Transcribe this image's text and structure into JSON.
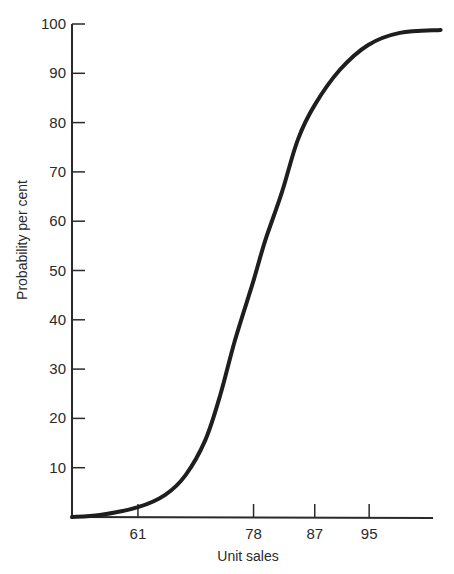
{
  "chart_data": {
    "type": "line",
    "title": "",
    "xlabel": "Unit sales",
    "ylabel": "Probability per cent",
    "xlim": [
      51.3,
      104.4
    ],
    "ylim": [
      0,
      100
    ],
    "x_ticks": [
      61,
      78,
      87,
      95
    ],
    "y_ticks": [
      10,
      20,
      30,
      40,
      50,
      60,
      70,
      80,
      90,
      100
    ],
    "grid": false,
    "legend": null,
    "series": [
      {
        "name": "Cumulative probability",
        "x": [
          51.3,
          55.4,
          61,
          65,
          68,
          70.9,
          73.1,
          75.3,
          78,
          79.7,
          82.2,
          84.5,
          87,
          90.7,
          94.8,
          99.5,
          105.5
        ],
        "y": [
          0,
          0.4,
          2,
          4.5,
          8.5,
          15.6,
          24.7,
          36,
          48,
          56,
          66,
          76.5,
          83.6,
          90.7,
          95.7,
          98.2,
          98.8
        ]
      }
    ],
    "style": {
      "line_color": "#1e1e1e",
      "axis_color": "#2a2a2a"
    }
  }
}
